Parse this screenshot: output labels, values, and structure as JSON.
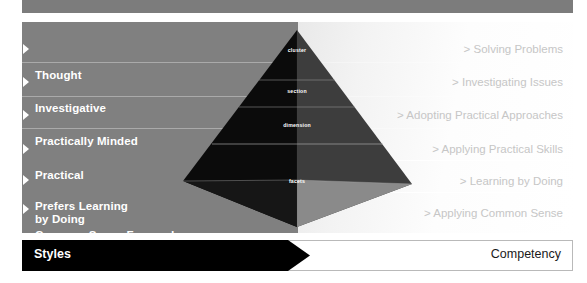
{
  "diagram": {
    "title_left": "Styles",
    "title_right": "Competency",
    "left_items": [
      {
        "label": "Thought"
      },
      {
        "label": "Investigative"
      },
      {
        "label": "Practically Minded"
      },
      {
        "label": "Practical"
      },
      {
        "label": "Prefers Learning\n by Doing"
      },
      {
        "label": "Common Sense Focused"
      }
    ],
    "right_items": [
      {
        "label": "> Solving Problems"
      },
      {
        "label": "> Investigating Issues"
      },
      {
        "label": "> Adopting Practical Approaches"
      },
      {
        "label": "> Applying Practical Skills"
      },
      {
        "label": "> Learning by Doing"
      },
      {
        "label": "> Applying Common Sense"
      }
    ],
    "pyramid_labels": [
      {
        "label": "cluster"
      },
      {
        "label": "section"
      },
      {
        "label": "dimension"
      },
      {
        "label": "facets"
      }
    ],
    "colors": {
      "panel_left": "#808080",
      "panel_right": "#ffffff",
      "header_bar": "#7c7c7c",
      "bar_left": "#000000",
      "left_text": "#ffffff",
      "right_text": "#c6c6c6",
      "pyramid_dark": "#0b0b0b",
      "pyramid_mid": "#3a3a3a",
      "pyramid_light": "#8f8f8f"
    }
  }
}
